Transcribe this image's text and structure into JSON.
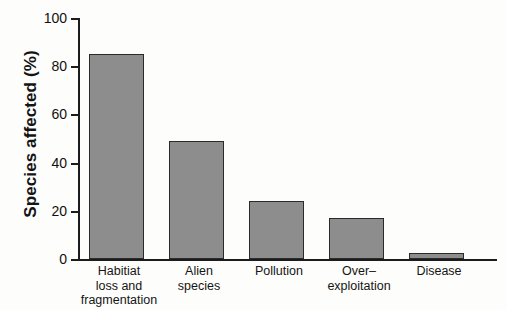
{
  "chart_data": {
    "type": "bar",
    "title": "",
    "xlabel": "",
    "ylabel": "Species affected (%)",
    "ylim": [
      0,
      100
    ],
    "grid": false,
    "legend": false,
    "categories": [
      "Habitiat loss and fragmentation",
      "Alien species",
      "Pollution",
      "Over–exploitation",
      "Disease"
    ],
    "category_lines": [
      [
        "Habitiat",
        "loss and",
        "fragmentation"
      ],
      [
        "Alien",
        "species"
      ],
      [
        "Pollution"
      ],
      [
        "Over–",
        "exploitation"
      ],
      [
        "Disease"
      ]
    ],
    "values": [
      85,
      49,
      24,
      17,
      2.5
    ],
    "yticks": [
      0,
      20,
      40,
      60,
      80,
      100
    ],
    "ytick_labels": [
      "0",
      "20",
      "40",
      "60",
      "80",
      "100"
    ],
    "bar_color": "#8d8d8d",
    "bar_edge_color": "#2a2a2a",
    "axis_color": "#1c1c1c",
    "background_color": "#fdfdfb"
  }
}
